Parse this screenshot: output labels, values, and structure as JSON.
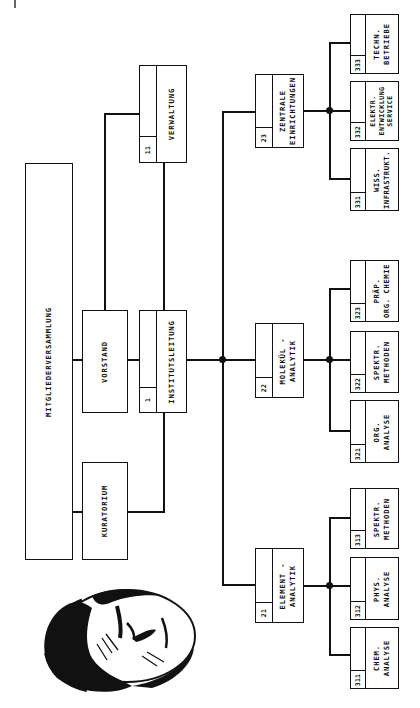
{
  "diagram": {
    "type": "organizational-chart",
    "orientation": "rotated-90-ccw",
    "governance": {
      "assembly": {
        "label": "MITGLIEDERVERSAMMLUNG"
      },
      "board": {
        "label": "VORSTAND"
      },
      "trustees": {
        "label": "KURATORIUM"
      }
    },
    "management": {
      "direction": {
        "number": "1",
        "label": "INSTITUTSLEITUNG"
      },
      "administration": {
        "number": "11",
        "label": "VERWALTUNG"
      }
    },
    "departments": [
      {
        "number": "21",
        "lines": [
          "ELEMENT -",
          "ANALYTIK"
        ],
        "groups": [
          {
            "number": "311",
            "lines": [
              "CHEM.",
              "ANALYSE"
            ]
          },
          {
            "number": "312",
            "lines": [
              "PHYS.",
              "ANALYSE"
            ]
          },
          {
            "number": "313",
            "lines": [
              "SPEKTR.",
              "METHODEN"
            ]
          }
        ]
      },
      {
        "number": "22",
        "lines": [
          "MOLEKÜL -",
          "ANALYTIK"
        ],
        "groups": [
          {
            "number": "321",
            "lines": [
              "ORG.",
              "ANALYSE"
            ]
          },
          {
            "number": "322",
            "lines": [
              "SPEKTR.",
              "METHODEN"
            ]
          },
          {
            "number": "323",
            "lines": [
              "PRÄP.",
              "ORG. CHEMIE"
            ]
          }
        ]
      },
      {
        "number": "23",
        "lines": [
          "ZENTRALE",
          "EINRICHTUNGEN"
        ],
        "groups": [
          {
            "number": "331",
            "lines": [
              "WISS.",
              "INFRASTRUKT."
            ]
          },
          {
            "number": "332",
            "lines": [
              "ELEKTR.",
              "ENTWICKLUNG",
              "SERVICE"
            ]
          },
          {
            "number": "333",
            "lines": [
              "TECHN.",
              "BETRIEBE"
            ]
          }
        ]
      }
    ],
    "portrait": {
      "icon": "portrait-engraving",
      "description": "engraved portrait of a man, rotated"
    },
    "colors": {
      "ink": "#111111",
      "paper": "#ffffff"
    }
  }
}
